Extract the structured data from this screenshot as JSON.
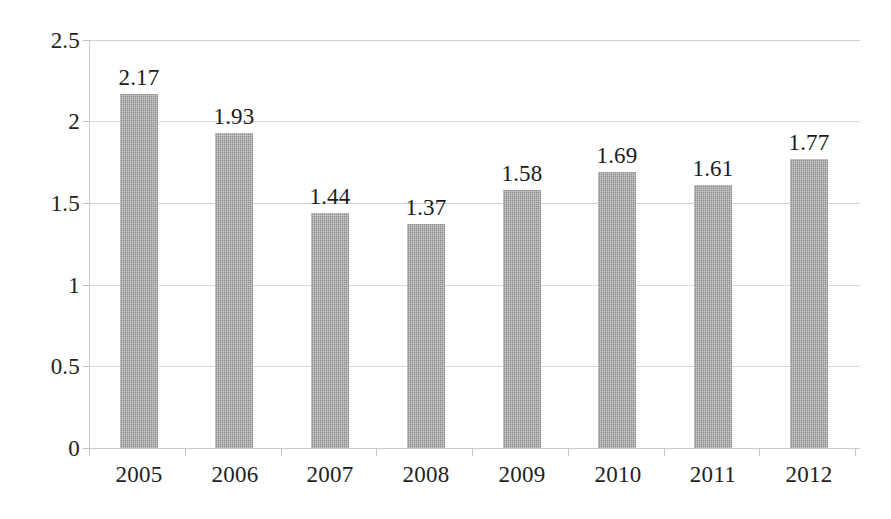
{
  "chart_data": {
    "type": "bar",
    "title": "",
    "subtitle": "",
    "xlabel": "",
    "ylabel": "",
    "categories": [
      "2005",
      "2006",
      "2007",
      "2008",
      "2009",
      "2010",
      "2011",
      "2012"
    ],
    "values": [
      2.17,
      1.93,
      1.44,
      1.37,
      1.58,
      1.69,
      1.61,
      1.77
    ],
    "data_labels": [
      "2.17",
      "1.93",
      "1.44",
      "1.37",
      "1.58",
      "1.69",
      "1.61",
      "1.77"
    ],
    "ylim": [
      0,
      2.5
    ],
    "ytick_labels": [
      "2.5",
      "2",
      "1.5",
      "1",
      "0.5",
      "0"
    ],
    "ytick_values": [
      2.5,
      2,
      1.5,
      1,
      0.5,
      0
    ],
    "grid": true,
    "grid_axis": "y",
    "legend": false,
    "legend_position": "none",
    "series_color": "#8e8e8e",
    "gridline_color": "#d9d9d9",
    "axis_color": "#cccccc",
    "text_color": "#1a1a1a",
    "background_color": "#ffffff"
  }
}
